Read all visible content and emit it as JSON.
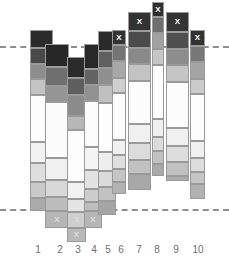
{
  "chart_data": {
    "type": "bar",
    "title": "",
    "xlabel": "",
    "ylabel": "",
    "subtitle": "",
    "grid": false,
    "legend": "none",
    "stacked": true,
    "categories": [
      "1",
      "2",
      "3",
      "4",
      "5",
      "6",
      "7",
      "8",
      "9",
      "10"
    ],
    "reference_lines": [
      {
        "name": "upper-reference-line",
        "y_px": 46,
        "style": "dashed",
        "color": "#8e8e8e"
      },
      {
        "name": "lower-reference-line",
        "y_px": 209,
        "style": "dashed",
        "color": "#8e8e8e"
      }
    ],
    "mark_symbol": "X",
    "annotations": [
      {
        "bar": "6",
        "position": "top",
        "symbol": "X"
      },
      {
        "bar": "7",
        "position": "top",
        "symbol": "X"
      },
      {
        "bar": "8",
        "position": "top",
        "symbol": "X"
      },
      {
        "bar": "9",
        "position": "top",
        "symbol": "X"
      },
      {
        "bar": "10",
        "position": "top",
        "symbol": "X"
      },
      {
        "bar": "2",
        "position": "bottom",
        "symbol": "X"
      },
      {
        "bar": "3",
        "position": "bottom",
        "symbol": "X"
      },
      {
        "bar": "3",
        "position": "bottom-2",
        "symbol": "X"
      },
      {
        "bar": "4",
        "position": "bottom",
        "symbol": "X"
      }
    ],
    "bars": [
      {
        "label": "1",
        "x_px": 30,
        "width_px": 23,
        "tick_x_px": 38,
        "segments": [
          {
            "top_px": 30,
            "height_px": 18,
            "color": "#2b2b2b",
            "mark": ""
          },
          {
            "top_px": 48,
            "height_px": 16,
            "color": "#494949",
            "mark": ""
          },
          {
            "top_px": 64,
            "height_px": 15,
            "color": "#8d8d8d",
            "mark": ""
          },
          {
            "top_px": 79,
            "height_px": 16,
            "color": "#c3c3c3",
            "mark": ""
          },
          {
            "top_px": 95,
            "height_px": 47,
            "color": "#fdfdfd",
            "mark": ""
          },
          {
            "top_px": 142,
            "height_px": 21,
            "color": "#f2f2f2",
            "mark": ""
          },
          {
            "top_px": 163,
            "height_px": 19,
            "color": "#dedede",
            "mark": ""
          },
          {
            "top_px": 182,
            "height_px": 16,
            "color": "#c9c9c9",
            "mark": ""
          },
          {
            "top_px": 198,
            "height_px": 13,
            "color": "#ababab",
            "mark": ""
          }
        ]
      },
      {
        "label": "2",
        "x_px": 45,
        "width_px": 24,
        "tick_x_px": 60,
        "segments": [
          {
            "top_px": 44,
            "height_px": 23,
            "color": "#272727",
            "mark": ""
          },
          {
            "top_px": 67,
            "height_px": 19,
            "color": "#6f6f6f",
            "mark": ""
          },
          {
            "top_px": 86,
            "height_px": 16,
            "color": "#959595",
            "mark": ""
          },
          {
            "top_px": 102,
            "height_px": 56,
            "color": "#fbfbfb",
            "mark": ""
          },
          {
            "top_px": 158,
            "height_px": 22,
            "color": "#f0f0f0",
            "mark": ""
          },
          {
            "top_px": 180,
            "height_px": 17,
            "color": "#d8d8d8",
            "mark": ""
          },
          {
            "top_px": 197,
            "height_px": 14,
            "color": "#bcbcbc",
            "mark": ""
          },
          {
            "top_px": 211,
            "height_px": 17,
            "color": "#b5b5b5",
            "mark": "X"
          }
        ]
      },
      {
        "label": "3",
        "x_px": 67,
        "width_px": 19,
        "tick_x_px": 78,
        "segments": [
          {
            "top_px": 57,
            "height_px": 21,
            "color": "#2b2b2b",
            "mark": ""
          },
          {
            "top_px": 78,
            "height_px": 17,
            "color": "#5e5e5e",
            "mark": ""
          },
          {
            "top_px": 95,
            "height_px": 21,
            "color": "#8b8b8b",
            "mark": ""
          },
          {
            "top_px": 116,
            "height_px": 14,
            "color": "#b7b7b7",
            "mark": ""
          },
          {
            "top_px": 130,
            "height_px": 52,
            "color": "#fdfdfd",
            "mark": ""
          },
          {
            "top_px": 182,
            "height_px": 17,
            "color": "#f2f2f2",
            "mark": ""
          },
          {
            "top_px": 199,
            "height_px": 13,
            "color": "#e4e4e4",
            "mark": ""
          },
          {
            "top_px": 212,
            "height_px": 16,
            "color": "#cfcfcf",
            "mark": "X"
          },
          {
            "top_px": 228,
            "height_px": 14,
            "color": "#b9b9b9",
            "mark": "X"
          }
        ]
      },
      {
        "label": "4",
        "x_px": 84,
        "width_px": 18,
        "tick_x_px": 94,
        "segments": [
          {
            "top_px": 44,
            "height_px": 25,
            "color": "#282828",
            "mark": ""
          },
          {
            "top_px": 69,
            "height_px": 16,
            "color": "#636363",
            "mark": ""
          },
          {
            "top_px": 85,
            "height_px": 16,
            "color": "#919191",
            "mark": ""
          },
          {
            "top_px": 101,
            "height_px": 46,
            "color": "#fcfcfc",
            "mark": ""
          },
          {
            "top_px": 147,
            "height_px": 23,
            "color": "#f4f4f4",
            "mark": ""
          },
          {
            "top_px": 170,
            "height_px": 19,
            "color": "#e2e2e2",
            "mark": ""
          },
          {
            "top_px": 189,
            "height_px": 13,
            "color": "#cccccc",
            "mark": ""
          },
          {
            "top_px": 202,
            "height_px": 9,
            "color": "#bdbdbd",
            "mark": ""
          },
          {
            "top_px": 211,
            "height_px": 17,
            "color": "#b5b5b5",
            "mark": "X"
          }
        ]
      },
      {
        "label": "5",
        "x_px": 98,
        "width_px": 18,
        "tick_x_px": 108,
        "segments": [
          {
            "top_px": 31,
            "height_px": 20,
            "color": "#2a2a2a",
            "mark": ""
          },
          {
            "top_px": 51,
            "height_px": 17,
            "color": "#606060",
            "mark": ""
          },
          {
            "top_px": 68,
            "height_px": 17,
            "color": "#8f8f8f",
            "mark": ""
          },
          {
            "top_px": 85,
            "height_px": 18,
            "color": "#c0c0c0",
            "mark": ""
          },
          {
            "top_px": 103,
            "height_px": 49,
            "color": "#fdfdfd",
            "mark": ""
          },
          {
            "top_px": 152,
            "height_px": 19,
            "color": "#eeeeee",
            "mark": ""
          },
          {
            "top_px": 171,
            "height_px": 16,
            "color": "#dadada",
            "mark": ""
          },
          {
            "top_px": 187,
            "height_px": 14,
            "color": "#c2c2c2",
            "mark": ""
          },
          {
            "top_px": 201,
            "height_px": 14,
            "color": "#a5a5a5",
            "mark": ""
          }
        ]
      },
      {
        "label": "6",
        "x_px": 112,
        "width_px": 14,
        "tick_x_px": 121,
        "segments": [
          {
            "top_px": 30,
            "height_px": 15,
            "color": "#333333",
            "mark": "X"
          },
          {
            "top_px": 45,
            "height_px": 16,
            "color": "#747474",
            "mark": ""
          },
          {
            "top_px": 61,
            "height_px": 17,
            "color": "#a8a8a8",
            "mark": ""
          },
          {
            "top_px": 78,
            "height_px": 15,
            "color": "#cfcfcf",
            "mark": ""
          },
          {
            "top_px": 93,
            "height_px": 47,
            "color": "#fdfdfd",
            "mark": ""
          },
          {
            "top_px": 140,
            "height_px": 15,
            "color": "#f1f1f1",
            "mark": ""
          },
          {
            "top_px": 155,
            "height_px": 14,
            "color": "#dfdfdf",
            "mark": ""
          },
          {
            "top_px": 169,
            "height_px": 13,
            "color": "#c4c4c4",
            "mark": ""
          },
          {
            "top_px": 182,
            "height_px": 12,
            "color": "#b2b2b2",
            "mark": ""
          }
        ]
      },
      {
        "label": "7",
        "x_px": 128,
        "width_px": 23,
        "tick_x_px": 139,
        "segments": [
          {
            "top_px": 12,
            "height_px": 19,
            "color": "#333333",
            "mark": "X"
          },
          {
            "top_px": 31,
            "height_px": 17,
            "color": "#4b4b4b",
            "mark": ""
          },
          {
            "top_px": 48,
            "height_px": 16,
            "color": "#898989",
            "mark": ""
          },
          {
            "top_px": 64,
            "height_px": 17,
            "color": "#c3c3c3",
            "mark": ""
          },
          {
            "top_px": 81,
            "height_px": 43,
            "color": "#fcfcfc",
            "mark": ""
          },
          {
            "top_px": 124,
            "height_px": 19,
            "color": "#f0f0f0",
            "mark": ""
          },
          {
            "top_px": 143,
            "height_px": 17,
            "color": "#dcdcdc",
            "mark": ""
          },
          {
            "top_px": 160,
            "height_px": 14,
            "color": "#c1c1c1",
            "mark": ""
          },
          {
            "top_px": 174,
            "height_px": 16,
            "color": "#a8a8a8",
            "mark": ""
          }
        ]
      },
      {
        "label": "8",
        "x_px": 152,
        "width_px": 12,
        "tick_x_px": 157,
        "segments": [
          {
            "top_px": 2,
            "height_px": 15,
            "color": "#2f2f2f",
            "mark": "X"
          },
          {
            "top_px": 17,
            "height_px": 16,
            "color": "#707070",
            "mark": ""
          },
          {
            "top_px": 33,
            "height_px": 16,
            "color": "#a1a1a1",
            "mark": ""
          },
          {
            "top_px": 49,
            "height_px": 16,
            "color": "#c6c6c6",
            "mark": ""
          },
          {
            "top_px": 65,
            "height_px": 54,
            "color": "#fdfdfd",
            "mark": ""
          },
          {
            "top_px": 119,
            "height_px": 18,
            "color": "#efefef",
            "mark": ""
          },
          {
            "top_px": 137,
            "height_px": 14,
            "color": "#dbdbdb",
            "mark": ""
          },
          {
            "top_px": 151,
            "height_px": 13,
            "color": "#c0c0c0",
            "mark": ""
          },
          {
            "top_px": 164,
            "height_px": 12,
            "color": "#a9a9a9",
            "mark": ""
          }
        ]
      },
      {
        "label": "9",
        "x_px": 166,
        "width_px": 23,
        "tick_x_px": 176,
        "segments": [
          {
            "top_px": 12,
            "height_px": 20,
            "color": "#343434",
            "mark": "X"
          },
          {
            "top_px": 32,
            "height_px": 17,
            "color": "#4f4f4f",
            "mark": ""
          },
          {
            "top_px": 49,
            "height_px": 16,
            "color": "#8c8c8c",
            "mark": ""
          },
          {
            "top_px": 65,
            "height_px": 17,
            "color": "#c5c5c5",
            "mark": ""
          },
          {
            "top_px": 82,
            "height_px": 46,
            "color": "#fcfcfc",
            "mark": ""
          },
          {
            "top_px": 128,
            "height_px": 18,
            "color": "#f0f0f0",
            "mark": ""
          },
          {
            "top_px": 146,
            "height_px": 16,
            "color": "#dcdcdc",
            "mark": ""
          },
          {
            "top_px": 162,
            "height_px": 14,
            "color": "#c0c0c0",
            "mark": ""
          },
          {
            "top_px": 176,
            "height_px": 5,
            "color": "#ababab",
            "mark": ""
          }
        ]
      },
      {
        "label": "10",
        "x_px": 190,
        "width_px": 15,
        "tick_x_px": 198,
        "segments": [
          {
            "top_px": 30,
            "height_px": 16,
            "color": "#323232",
            "mark": "X"
          },
          {
            "top_px": 46,
            "height_px": 16,
            "color": "#777777",
            "mark": ""
          },
          {
            "top_px": 62,
            "height_px": 17,
            "color": "#a4a4a4",
            "mark": ""
          },
          {
            "top_px": 79,
            "height_px": 15,
            "color": "#cbcbcb",
            "mark": ""
          },
          {
            "top_px": 94,
            "height_px": 47,
            "color": "#fdfdfd",
            "mark": ""
          },
          {
            "top_px": 141,
            "height_px": 17,
            "color": "#f0f0f0",
            "mark": ""
          },
          {
            "top_px": 158,
            "height_px": 14,
            "color": "#dddddd",
            "mark": ""
          },
          {
            "top_px": 172,
            "height_px": 12,
            "color": "#c5c5c5",
            "mark": ""
          },
          {
            "top_px": 184,
            "height_px": 15,
            "color": "#b1b1b1",
            "mark": ""
          }
        ]
      }
    ]
  }
}
